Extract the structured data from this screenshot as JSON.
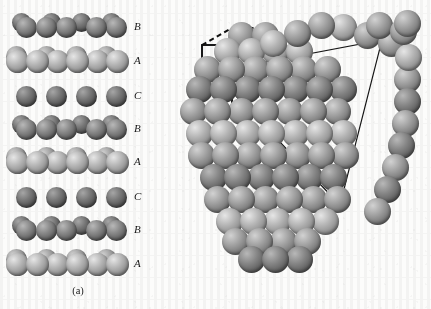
{
  "figure": {
    "background_color": "#fcfcfb",
    "sphere_colors": {
      "highlight": "#e6e6e6",
      "midtone": "#a0a0a0",
      "shadow": "#5d5d5d",
      "edge": "#3d3d3d"
    },
    "line_color": "#1a1a1a"
  },
  "panel_a": {
    "caption": "(a)",
    "description": "Side view of stacked close-packed layers",
    "stacking_sequence": [
      "B",
      "A",
      "C",
      "B",
      "A",
      "C",
      "B",
      "A"
    ],
    "layer_labels": [
      {
        "label": "B",
        "y": 26
      },
      {
        "label": "A",
        "y": 60
      },
      {
        "label": "C",
        "y": 95
      },
      {
        "label": "B",
        "y": 128
      },
      {
        "label": "A",
        "y": 161
      },
      {
        "label": "C",
        "y": 196
      },
      {
        "label": "B",
        "y": 229
      },
      {
        "label": "A",
        "y": 263
      }
    ]
  },
  "panel_b": {
    "caption": "(b)",
    "description": "Face-centred cubic cluster of close-packed spheres with unit cell and (111) close-packed plane outlined",
    "annotations": {
      "unit_cell": {
        "name": "unit-cell-cube",
        "front_face_style": "solid",
        "back_edges_style": "dashed"
      },
      "close_packed_plane": {
        "name": "close-packed-plane-triangle",
        "style": "solid",
        "sides": 3
      }
    }
  }
}
